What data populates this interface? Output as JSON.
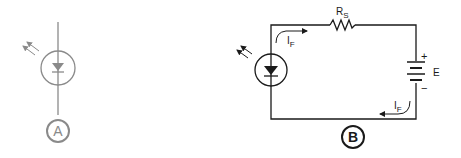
{
  "figure_a": {
    "label": "A",
    "component": "photodiode-symbol",
    "color": "#8a8a8a"
  },
  "figure_b": {
    "label": "B",
    "resistor": {
      "name": "R",
      "subscript": "S"
    },
    "battery": {
      "name": "E",
      "plus": "+",
      "minus": "−"
    },
    "current_top": {
      "name": "I",
      "subscript": "F"
    },
    "current_bottom": {
      "name": "I",
      "subscript": "F"
    },
    "color": "#1a1a1a"
  }
}
